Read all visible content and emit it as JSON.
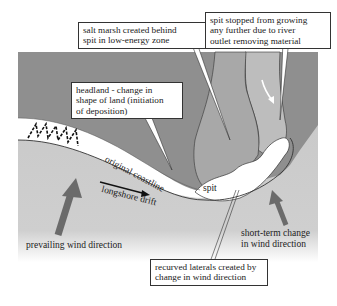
{
  "diagram": {
    "labels": {
      "salt_marsh": [
        "salt marsh created behind",
        "spit in low-energy zone"
      ],
      "spit_stopped": [
        "spit stopped from growing",
        "any further due to river",
        "outlet removing material"
      ],
      "headland": [
        "headland - change in",
        "shape of land (initiation",
        "of deposition)"
      ],
      "original_coastline": "original coastline",
      "longshore_drift": "longshore drift",
      "spit": "spit",
      "prevailing_wind": "prevailing wind direction",
      "short_term_change": [
        "short-term change",
        "in wind direction"
      ],
      "recurved_laterals": [
        "recurved laterals created by",
        "change in wind direction"
      ]
    },
    "colors": {
      "sea": "#c9c9c9",
      "land": "#8f8f8f",
      "marsh": "#a9a9a9",
      "river": "#bdbdbd",
      "spit": "#ffffff",
      "arrow": "#6b6b6b"
    }
  }
}
